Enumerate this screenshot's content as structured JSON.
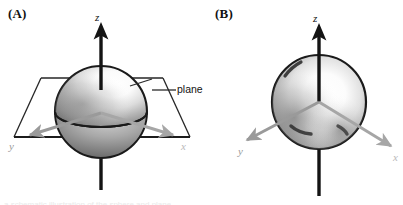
{
  "figure": {
    "background_color": "#ffffff",
    "panels": [
      {
        "id": "A",
        "label": "(A)",
        "description": "Hemisphere intersected by a horizontal plane with x, y, z axes",
        "axes": [
          {
            "name": "z",
            "label": "z",
            "color": "#141414",
            "direction": "up"
          },
          {
            "name": "y",
            "label": "y",
            "color": "#9a9a9a",
            "direction": "lower-left"
          },
          {
            "name": "x",
            "label": "x",
            "color": "#b9b9b9",
            "direction": "lower-right"
          }
        ],
        "annotations": [
          {
            "name": "plane",
            "label": "plane"
          }
        ]
      },
      {
        "id": "B",
        "label": "(B)",
        "description": "Full sphere with x, y, z axes and no cutting plane",
        "axes": [
          {
            "name": "z",
            "label": "z",
            "color": "#141414",
            "direction": "up"
          },
          {
            "name": "y",
            "label": "y",
            "color": "#9a9a9a",
            "direction": "lower-left"
          },
          {
            "name": "x",
            "label": "x",
            "color": "#b9b9b9",
            "direction": "lower-right"
          }
        ],
        "annotations": []
      }
    ],
    "colors": {
      "axis_black": "#141414",
      "axis_gray": "#9a9a9a",
      "outline": "#1a1a1a",
      "sphere_highlight": "#ffffff",
      "sphere_shadow": "#6f6f6f",
      "plane_outline": "#262626"
    },
    "caption_sliver": "a schematic illustration of the sphere and plane"
  }
}
